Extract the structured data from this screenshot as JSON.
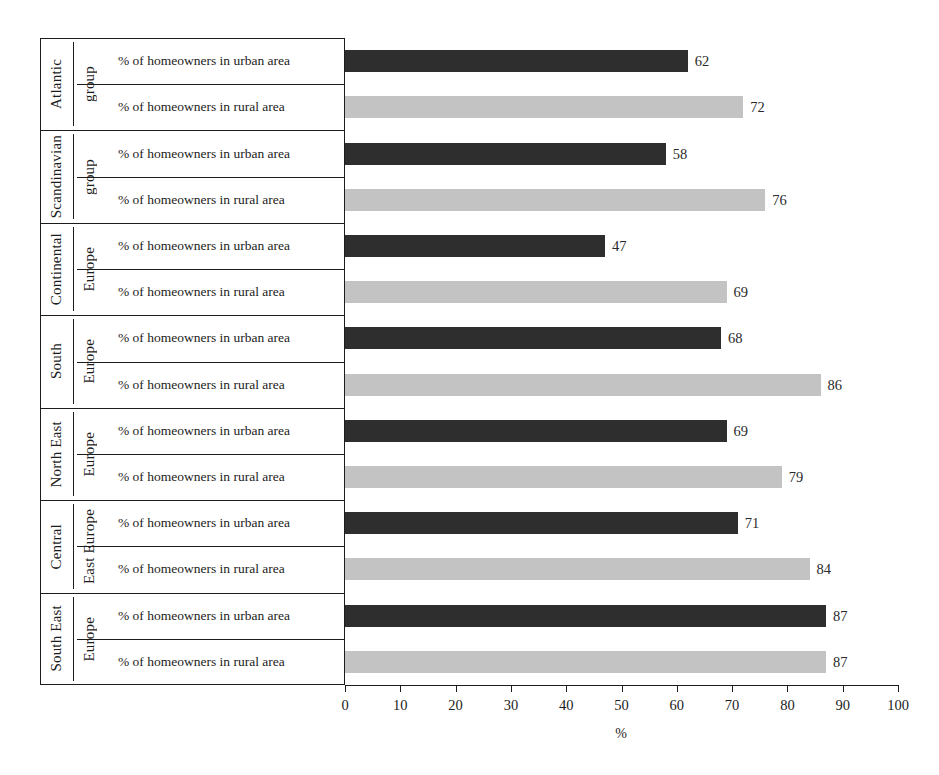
{
  "chart_data": {
    "type": "bar",
    "orientation": "horizontal",
    "title": "",
    "xlabel": "%",
    "ylabel": "",
    "xlim": [
      0,
      100
    ],
    "xticks": [
      0,
      10,
      20,
      30,
      40,
      50,
      60,
      70,
      80,
      90,
      100
    ],
    "grid": false,
    "legend": "none",
    "series": [
      {
        "name": "% of homeowners in urban area",
        "color": "#2e2e2e",
        "values": [
          62,
          58,
          47,
          68,
          69,
          71,
          87
        ]
      },
      {
        "name": "% of homeowners in rural area",
        "color": "#c3c3c3",
        "values": [
          72,
          76,
          69,
          86,
          79,
          84,
          87
        ]
      }
    ],
    "categories": [
      "Atlantic group",
      "Scandinavian group",
      "Continental Europe",
      "South Europe",
      "North East Europe",
      "Central East Europe",
      "South East Europe"
    ],
    "groups": [
      {
        "name_line1": "Atlantic",
        "name_line2": "group",
        "rows": [
          {
            "label": "% of homeowners in urban area",
            "value": 62,
            "type": "urban"
          },
          {
            "label": "% of homeowners in rural area",
            "value": 72,
            "type": "rural"
          }
        ]
      },
      {
        "name_line1": "Scandinavian",
        "name_line2": "group",
        "rows": [
          {
            "label": "% of homeowners in urban area",
            "value": 58,
            "type": "urban"
          },
          {
            "label": "% of homeowners in rural area",
            "value": 76,
            "type": "rural"
          }
        ]
      },
      {
        "name_line1": "Continental",
        "name_line2": "Europe",
        "rows": [
          {
            "label": "% of homeowners in urban area",
            "value": 47,
            "type": "urban"
          },
          {
            "label": "% of homeowners in rural area",
            "value": 69,
            "type": "rural"
          }
        ]
      },
      {
        "name_line1": "South",
        "name_line2": "Europe",
        "rows": [
          {
            "label": "% of homeowners in urban area",
            "value": 68,
            "type": "urban"
          },
          {
            "label": "% of homeowners in rural area",
            "value": 86,
            "type": "rural"
          }
        ]
      },
      {
        "name_line1": "North East",
        "name_line2": "Europe",
        "rows": [
          {
            "label": "% of homeowners in urban area",
            "value": 69,
            "type": "urban"
          },
          {
            "label": "% of homeowners in rural area",
            "value": 79,
            "type": "rural"
          }
        ]
      },
      {
        "name_line1": "Central",
        "name_line2": "East Europe",
        "rows": [
          {
            "label": "% of homeowners in urban area",
            "value": 71,
            "type": "urban"
          },
          {
            "label": "% of homeowners in rural area",
            "value": 84,
            "type": "rural"
          }
        ]
      },
      {
        "name_line1": "South East",
        "name_line2": "Europe",
        "rows": [
          {
            "label": "% of homeowners in urban area",
            "value": 87,
            "type": "urban"
          },
          {
            "label": "% of homeowners in rural area",
            "value": 87,
            "type": "rural"
          }
        ]
      }
    ]
  },
  "colors": {
    "urban_bar": "#2e2e2e",
    "rural_bar": "#c3c3c3",
    "line": "#1c1c1c",
    "background": "#ffffff"
  }
}
